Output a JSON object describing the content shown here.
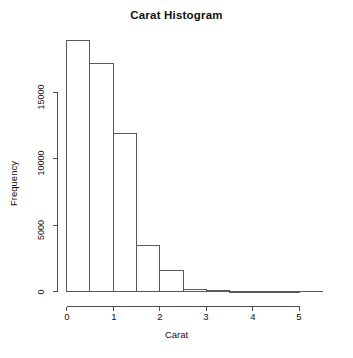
{
  "chart_data": {
    "type": "bar",
    "title": "Carat Histogram",
    "xlabel": "Carat",
    "ylabel": "Frequency",
    "xlim": [
      0,
      5.5
    ],
    "ylim": [
      0,
      18000
    ],
    "grid": false,
    "legend": null,
    "bin_width": 0.5,
    "x_ticks": [
      0,
      1,
      2,
      3,
      4,
      5
    ],
    "x_tick_labels": [
      "0",
      "1",
      "2",
      "3",
      "4",
      "5"
    ],
    "y_ticks": [
      0,
      5000,
      10000,
      15000
    ],
    "y_tick_labels": [
      "0",
      "5000",
      "10000",
      "15000"
    ],
    "categories": [
      "0-0.5",
      "0.5-1",
      "1-1.5",
      "1.5-2",
      "2-2.5",
      "2.5-3",
      "3-3.5",
      "3.5-4",
      "4-4.5",
      "4.5-5"
    ],
    "bin_edges": [
      0,
      0.5,
      1.0,
      1.5,
      2.0,
      2.5,
      3.0,
      3.5,
      4.0,
      4.5,
      5.0
    ],
    "values": [
      18900,
      17200,
      11900,
      3450,
      1580,
      170,
      40,
      6,
      2,
      1
    ]
  },
  "axes": {
    "y_axis_label": "Frequency",
    "x_axis_label": "Carat",
    "axis_color": "#4d4d4d",
    "bar_border_color": "#595959",
    "bar_fill_color": "#ffffff"
  }
}
